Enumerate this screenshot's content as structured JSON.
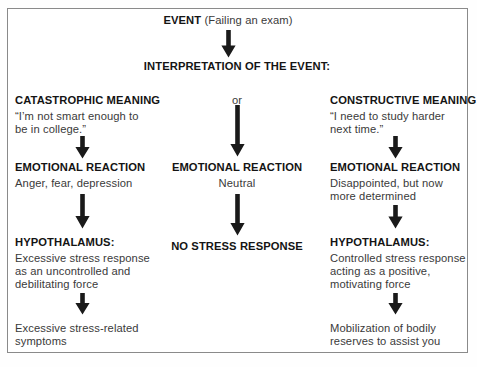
{
  "diagram": {
    "title_event": "EVENT",
    "title_event_detail": "(Failing an exam)",
    "interpretation": "INTERPRETATION OF THE EVENT:",
    "or_label": "or"
  },
  "columns": {
    "left": {
      "meaning_heading": "CATASTROPHIC MEANING",
      "meaning_quote_line1": "“I’m not smart enough to",
      "meaning_quote_line2": "be in college.”",
      "reaction_heading": "EMOTIONAL REACTION",
      "reaction_text": "Anger, fear, depression",
      "hypothalamus_heading": "HYPOTHALAMUS:",
      "hypothalamus_line1": "Excessive stress response",
      "hypothalamus_line2": "as an uncontrolled and",
      "hypothalamus_line3": "debilitating force",
      "outcome_line1": "Excessive stress-related",
      "outcome_line2": "symptoms"
    },
    "middle": {
      "reaction_heading": "EMOTIONAL REACTION",
      "reaction_text": "Neutral",
      "outcome": "NO STRESS RESPONSE"
    },
    "right": {
      "meaning_heading": "CONSTRUCTIVE MEANING",
      "meaning_quote_line1": "“I need to study harder",
      "meaning_quote_line2": "next time.”",
      "reaction_heading": "EMOTIONAL REACTION",
      "reaction_line1": "Disappointed, but now",
      "reaction_line2": "more determined",
      "hypothalamus_heading": "HYPOTHALAMUS:",
      "hypothalamus_line1": "Controlled stress response",
      "hypothalamus_line2": "acting as a positive,",
      "hypothalamus_line3": "motivating force",
      "outcome_line1": "Mobilization of bodily",
      "outcome_line2": "reserves to assist you"
    }
  },
  "style": {
    "arrow_color": "#1a1a1a",
    "frame_color": "#8a8a8a",
    "heading_color": "#141414",
    "body_color": "#3a3a3a"
  }
}
